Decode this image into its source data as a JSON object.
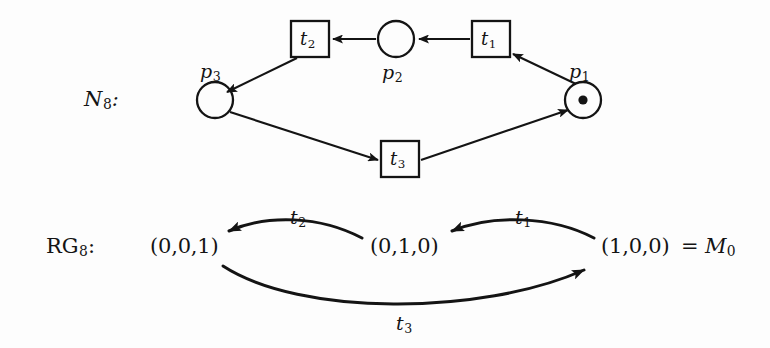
{
  "figure": {
    "background_color": "#fdfdfd",
    "ink_color": "#141414"
  },
  "petri_net": {
    "name": "N",
    "name_subscript": "8",
    "name_suffix": ":",
    "places": [
      {
        "id": "p1",
        "label": "p",
        "subscript": "1",
        "tokens": 1,
        "token_glyph": "dot",
        "cx": 583,
        "cy": 100,
        "r": 18
      },
      {
        "id": "p2",
        "label": "p",
        "subscript": "2",
        "tokens": 0,
        "token_glyph": "",
        "cx": 396,
        "cy": 39,
        "r": 18
      },
      {
        "id": "p3",
        "label": "p",
        "subscript": "3",
        "tokens": 0,
        "token_glyph": "",
        "cx": 215,
        "cy": 100,
        "r": 18
      }
    ],
    "transitions": [
      {
        "id": "t1",
        "label": "t",
        "subscript": "1",
        "x": 472,
        "y": 21,
        "w": 38,
        "h": 36
      },
      {
        "id": "t2",
        "label": "t",
        "subscript": "2",
        "x": 291,
        "y": 21,
        "w": 38,
        "h": 36
      },
      {
        "id": "t3",
        "label": "t",
        "subscript": "3",
        "x": 381,
        "y": 141,
        "w": 38,
        "h": 36
      }
    ],
    "arcs": [
      {
        "from": "t1",
        "to": "p2",
        "shape": "straight"
      },
      {
        "from": "p2",
        "to": "t2",
        "shape": "straight"
      },
      {
        "from": "t2",
        "to": "p3",
        "shape": "straight"
      },
      {
        "from": "p3",
        "to": "t3",
        "shape": "straight"
      },
      {
        "from": "t3",
        "to": "p1",
        "shape": "straight"
      },
      {
        "from": "p1",
        "to": "t1",
        "shape": "straight"
      }
    ]
  },
  "reachability_graph": {
    "name": "RG",
    "name_subscript": "8",
    "name_suffix": ":",
    "states": [
      {
        "id": "s001",
        "text": "(0,0,1)",
        "x": 150,
        "y": 237
      },
      {
        "id": "s010",
        "text": "(0,1,0)",
        "x": 370,
        "y": 237
      },
      {
        "id": "s100",
        "text": "(1,0,0)",
        "x": 601,
        "y": 237
      }
    ],
    "initial_marking": {
      "equals": "=",
      "label": "M",
      "subscript": "0",
      "x": 692,
      "y": 237
    },
    "edges": [
      {
        "id": "e_t2",
        "from": "s010",
        "to": "s001",
        "label": "t",
        "subscript": "2",
        "label_x": 290,
        "label_y": 208,
        "curve": "up"
      },
      {
        "id": "e_t1",
        "from": "s100",
        "to": "s010",
        "label": "t",
        "subscript": "1",
        "label_x": 515,
        "label_y": 208,
        "curve": "up"
      },
      {
        "id": "e_t3",
        "from": "s001",
        "to": "s100",
        "label": "t",
        "subscript": "3",
        "label_x": 396,
        "label_y": 314,
        "curve": "down"
      }
    ]
  }
}
